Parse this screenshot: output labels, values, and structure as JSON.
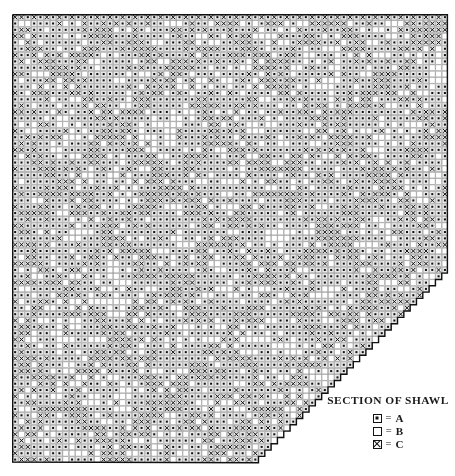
{
  "document": {
    "kind": "knitting-pattern-chart",
    "title": "SECTION OF SHAWL"
  },
  "legend": {
    "title": "SECTION OF SHAWL",
    "equals": "=",
    "items": [
      {
        "symbol": "dot",
        "symbol_name": "dot-in-square-symbol",
        "label": "A"
      },
      {
        "symbol": "blank",
        "symbol_name": "empty-square-symbol",
        "label": "B"
      },
      {
        "symbol": "ex",
        "symbol_name": "cross-in-square-symbol",
        "label": "C"
      }
    ]
  },
  "chart_data": {
    "type": "heatmap",
    "title": "SECTION OF SHAWL",
    "xlabel": "",
    "ylabel": "",
    "grid": true,
    "legend_position": "bottom-right",
    "columns": 69,
    "rows": 71,
    "cell_size_px": 6.32,
    "origin_px": [
      12,
      14
    ],
    "symbols": {
      "A": "dot",
      "B": "blank",
      "C": "cross"
    },
    "colors": {
      "grid_line": "#9a9a9a",
      "border": "#111111",
      "mark": "#111111",
      "background": "#ffffff",
      "cell_a_fill": "#e8e8e8"
    },
    "shape": "rectangle-with-diagonal-cut-bottom-right",
    "diagonal": {
      "start_cell": [
        68,
        40
      ],
      "end_cell": [
        37,
        70
      ],
      "description": "staircase diagonal from right edge at row 40 down-left to bottom edge at column 37"
    },
    "density": {
      "A": 0.46,
      "B": 0.33,
      "C": 0.21
    },
    "seed": 20240117,
    "motif": "diagonal lattice of crossed-stitch bands on dotted ground"
  }
}
